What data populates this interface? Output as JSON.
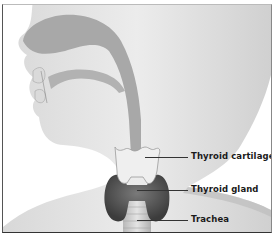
{
  "diagram": {
    "labels": [
      {
        "id": "thyroid-cartilage",
        "text": "Thyroid cartilage"
      },
      {
        "id": "thyroid-gland",
        "text": "Thyroid gland"
      },
      {
        "id": "trachea",
        "text": "Trachea"
      }
    ],
    "colors": {
      "skin": "#e6e6e6",
      "skin_shadow": "#c9c9c9",
      "airway": "#a9a9a9",
      "cartilage": "#efefef",
      "gland": "#5a5a5a",
      "trachea": "#d2d2d2",
      "text": "#1a1a1a"
    }
  }
}
